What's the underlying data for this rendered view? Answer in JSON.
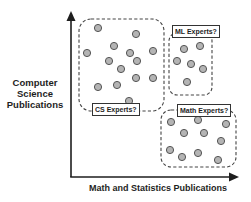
{
  "diagram": {
    "y_axis_label": "Computer Science Publications",
    "y_axis_lines": [
      "Computer",
      "Science",
      "Publications"
    ],
    "x_axis_label": "Math and Statistics Publications",
    "colors": {
      "dot_fill": "#b4b4b4",
      "dot_stroke": "#555555",
      "axis": "#1e1e1e",
      "dash": "#444444"
    },
    "groups": [
      {
        "label": "CS Experts?",
        "box": {
          "x": 79,
          "y": 19,
          "w": 85,
          "h": 92,
          "r": 12
        },
        "label_pos": {
          "x": 92,
          "y": 103
        },
        "points": [
          [
            98,
            28
          ],
          [
            136,
            34
          ],
          [
            87,
            53
          ],
          [
            114,
            46
          ],
          [
            130,
            53
          ],
          [
            153,
            51
          ],
          [
            109,
            61
          ],
          [
            137,
            61
          ],
          [
            121,
            69
          ],
          [
            136,
            78
          ],
          [
            153,
            78
          ],
          [
            98,
            87
          ],
          [
            117,
            85
          ],
          [
            129,
            101
          ]
        ]
      },
      {
        "label": "ML Experts?",
        "box": {
          "x": 169,
          "y": 33,
          "w": 43,
          "h": 62,
          "r": 8
        },
        "label_pos": {
          "x": 172,
          "y": 25
        },
        "points": [
          [
            184,
            49
          ],
          [
            200,
            46
          ],
          [
            177,
            61
          ],
          [
            191,
            64
          ],
          [
            203,
            69
          ],
          [
            187,
            82
          ]
        ]
      },
      {
        "label": "Math Experts?",
        "box": {
          "x": 161,
          "y": 110,
          "w": 75,
          "h": 57,
          "r": 10
        },
        "label_pos": {
          "x": 177,
          "y": 104
        },
        "points": [
          [
            171,
            122
          ],
          [
            198,
            120
          ],
          [
            226,
            124
          ],
          [
            184,
            133
          ],
          [
            204,
            133
          ],
          [
            221,
            141
          ],
          [
            170,
            150
          ],
          [
            182,
            157
          ],
          [
            198,
            153
          ],
          [
            218,
            160
          ]
        ]
      }
    ]
  }
}
